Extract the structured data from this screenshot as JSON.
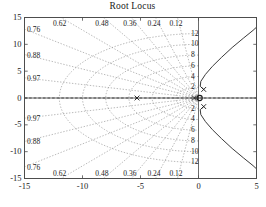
{
  "figure": {
    "title": "Root Locus",
    "background": "#ffffff",
    "axis_color": "#4d4d4d",
    "grid_color": "#8c8c8c",
    "locus_color": "#3a3a3a",
    "marker_color": "#1a1a1a"
  },
  "chart_data": {
    "type": "line",
    "title": "Root Locus",
    "xlabel": "",
    "ylabel": "",
    "xlim": [
      -15,
      5
    ],
    "ylim": [
      -15,
      15
    ],
    "grid": true,
    "grid_style": "s-plane damping and natural-frequency grid (dotted)",
    "legend": "none",
    "xticks": [
      -15,
      -10,
      -5,
      0,
      5
    ],
    "xticklabels": [
      "-15",
      "-10",
      "-5",
      "0",
      "5"
    ],
    "yticks": [
      -15,
      -10,
      -5,
      0,
      5,
      10,
      15
    ],
    "yticklabels": [
      "-15",
      "-10",
      "-5",
      "0",
      "5",
      "10",
      "15"
    ],
    "damping_ratios": [
      0.12,
      0.24,
      0.36,
      0.48,
      0.62,
      0.76,
      0.88,
      0.97
    ],
    "damping_labels": [
      "0.12",
      "0.24",
      "0.36",
      "0.48",
      "0.62",
      "0.76",
      "0.88",
      "0.97"
    ],
    "natural_frequencies": [
      2,
      4,
      6,
      8,
      10,
      12
    ],
    "frequency_labels": [
      "2",
      "4",
      "6",
      "8",
      "10",
      "12"
    ],
    "poles": [
      {
        "x": -5.3,
        "y": 0,
        "marker": "x"
      },
      {
        "x": -0.35,
        "y": 0,
        "marker": "x"
      },
      {
        "x": 0.45,
        "y": 1.6,
        "marker": "x"
      },
      {
        "x": 0.45,
        "y": -1.6,
        "marker": "x"
      }
    ],
    "zeros": [
      {
        "x": 0.1,
        "y": 0,
        "marker": "o"
      }
    ],
    "series": [
      {
        "name": "locus-branch-upper",
        "points": [
          [
            0.45,
            1.55
          ],
          [
            0.15,
            2.2
          ],
          [
            0.2,
            3.1
          ],
          [
            0.6,
            4.4
          ],
          [
            1.2,
            5.9
          ],
          [
            2.0,
            7.6
          ],
          [
            2.9,
            9.4
          ],
          [
            3.9,
            11.2
          ],
          [
            4.7,
            12.6
          ],
          [
            5.0,
            13.2
          ]
        ]
      },
      {
        "name": "locus-branch-lower",
        "points": [
          [
            0.45,
            -1.55
          ],
          [
            0.15,
            -2.2
          ],
          [
            0.2,
            -3.1
          ],
          [
            0.6,
            -4.4
          ],
          [
            1.2,
            -5.9
          ],
          [
            2.0,
            -7.6
          ],
          [
            2.9,
            -9.4
          ],
          [
            3.9,
            -11.2
          ],
          [
            4.7,
            -12.6
          ],
          [
            5.0,
            -13.2
          ]
        ]
      },
      {
        "name": "locus-branch-real-axis",
        "points": [
          [
            -15,
            0
          ],
          [
            -5.3,
            0
          ],
          [
            -0.35,
            0
          ],
          [
            0.1,
            0
          ],
          [
            5,
            0
          ]
        ]
      }
    ]
  }
}
